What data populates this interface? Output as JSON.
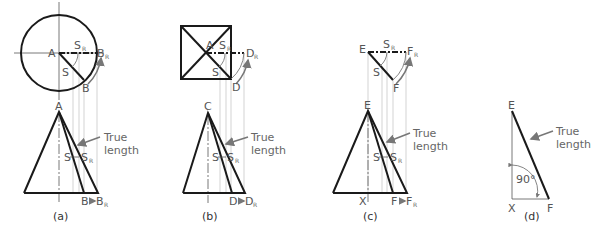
{
  "figure": {
    "panels": [
      {
        "id": "a",
        "caption": "(a)",
        "top_view_shape": "circle",
        "labels": {
          "center": "A",
          "s": "S",
          "sr": "S",
          "sr_sub": "R",
          "end": "B",
          "end_r": "B",
          "end_r_sub": "R",
          "apex": "A",
          "bottom_s": "S",
          "bottom_sr": "S",
          "bottom_sr_sub": "R",
          "bottom_end": "B",
          "bottom_end_r": "B",
          "bottom_end_r_sub": "R",
          "true_length_1": "True",
          "true_length_2": "length"
        }
      },
      {
        "id": "b",
        "caption": "(b)",
        "top_view_shape": "square",
        "labels": {
          "center": "A",
          "s": "S",
          "sr": "S",
          "sr_sub": "R",
          "end": "D",
          "end_r": "D",
          "end_r_sub": "R",
          "apex": "C",
          "bottom_s": "S",
          "bottom_sr": "S",
          "bottom_sr_sub": "R",
          "bottom_end": "D",
          "bottom_end_r": "D",
          "bottom_end_r_sub": "R",
          "true_length_1": "True",
          "true_length_2": "length"
        }
      },
      {
        "id": "c",
        "caption": "(c)",
        "top_view_shape": "triangle",
        "labels": {
          "center": "E",
          "s": "S",
          "sr": "S",
          "sr_sub": "R",
          "end": "F",
          "end_r": "F",
          "end_r_sub": "R",
          "apex": "E",
          "bottom_s": "S",
          "bottom_sr": "S",
          "bottom_sr_sub": "R",
          "bottom_x": "X",
          "bottom_end": "F",
          "bottom_end_r": "F",
          "bottom_end_r_sub": "R",
          "true_length_1": "True",
          "true_length_2": "length"
        }
      },
      {
        "id": "d",
        "caption": "(d)",
        "top_view_shape": "none",
        "labels": {
          "apex": "E",
          "bottom_x": "X",
          "bottom_end": "F",
          "angle": "90°",
          "true_length_1": "True",
          "true_length_2": "length"
        }
      }
    ],
    "colors": {
      "line": "#1a1a1a",
      "label": "#555555",
      "projection": "#c8c8c8",
      "arrow": "#777777"
    }
  }
}
